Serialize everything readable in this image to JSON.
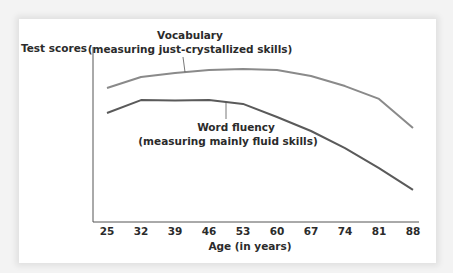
{
  "chart_data": {
    "type": "line",
    "title": "",
    "xlabel": "Age (in years)",
    "ylabel": "Test scores",
    "x": [
      25,
      32,
      39,
      46,
      53,
      60,
      67,
      74,
      81,
      88
    ],
    "x_tick_labels": [
      "25",
      "32",
      "39",
      "46",
      "53",
      "60",
      "67",
      "74",
      "81",
      "88"
    ],
    "xlim": [
      25,
      88
    ],
    "ylim": [
      0,
      100
    ],
    "y_values_note": "Y axis has no tick labels; values are relative estimates on a 0-100 scale",
    "grid": false,
    "legend": "inline annotations",
    "series": [
      {
        "name": "Vocabulary",
        "annotation_line1": "Vocabulary",
        "annotation_line2": "(measuring just-crystallized skills)",
        "color": "#8a8a8a",
        "values": [
          69.8,
          75.5,
          77.6,
          79.2,
          79.7,
          79.2,
          76.0,
          70.8,
          64.1,
          49.0
        ],
        "annotation_anchor_x": 46
      },
      {
        "name": "Word fluency",
        "annotation_line1": "Word fluency",
        "annotation_line2": "(measuring mainly fluid skills)",
        "color": "#5a5a5a",
        "values": [
          56.8,
          63.5,
          63.3,
          63.5,
          61.5,
          54.7,
          47.4,
          38.5,
          28.1,
          16.7
        ],
        "annotation_anchor_x": 53
      }
    ]
  }
}
